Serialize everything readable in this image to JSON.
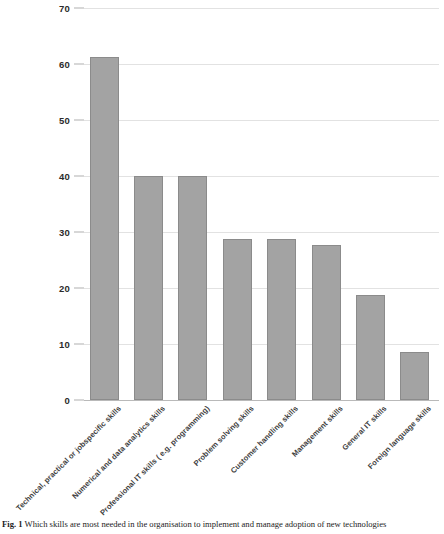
{
  "figure": {
    "caption_label": "Fig. 1",
    "caption_text": "Which skills are most needed in the organisation to implement and manage adoption of new technologies"
  },
  "chart_data": {
    "type": "bar",
    "title": "",
    "xlabel": "",
    "ylabel": "",
    "ylim": [
      0,
      70
    ],
    "grid": true,
    "legend": "none",
    "categories": [
      "Technical, practical or jobspecific skills",
      "Numerical and data analytics skills",
      "Professional IT skills ( e.g. programming)",
      "Problem solving skills",
      "Customer handling skills",
      "Management skills",
      "General IT skills",
      "Foreign language skills"
    ],
    "values": [
      61.2,
      40,
      40,
      28.8,
      28.8,
      27.6,
      18.7,
      8.6
    ],
    "yticks": [
      0,
      10,
      20,
      30,
      40,
      50,
      60,
      70
    ],
    "ytick_labels": [
      "0",
      "10",
      "20",
      "30",
      "40",
      "50",
      "60",
      "70"
    ],
    "colors": {
      "bar_fill": "#a3a3a3",
      "bar_border": "#8b8b8b",
      "gridline": "#e2e2e2",
      "axis": "#b9b9b9",
      "text": "#3f3f3f"
    }
  }
}
